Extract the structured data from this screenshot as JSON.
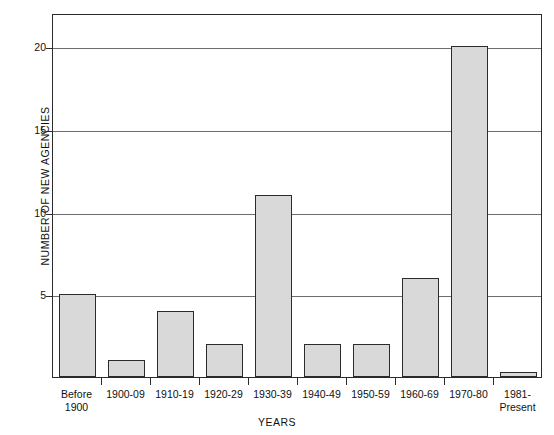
{
  "chart_data": {
    "type": "bar",
    "title": "",
    "xlabel": "YEARS",
    "ylabel": "NUMBER OF NEW AGENCIES",
    "categories": [
      "Before\n1900",
      "1900-09",
      "1910-19",
      "1920-29",
      "1930-39",
      "1940-49",
      "1950-59",
      "1960-69",
      "1970-80",
      "1981-\nPresent"
    ],
    "values": [
      5,
      1,
      4,
      2,
      11,
      2,
      2,
      6,
      20,
      0.3
    ],
    "ylim": [
      0,
      22
    ],
    "yticks": [
      5,
      10,
      15,
      20
    ],
    "ytick_labels": [
      "5",
      "10",
      "15",
      "20"
    ],
    "grid": true,
    "legend": "none",
    "bar_fill_color": "#d9d9d9",
    "bar_edge_color": "#2b2b2b",
    "axis_color": "#2b2b2b",
    "gridline_color": "#6d6d6d",
    "background_color": "#ffffff"
  }
}
